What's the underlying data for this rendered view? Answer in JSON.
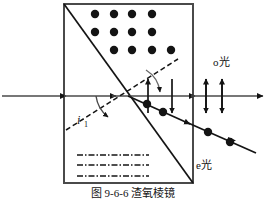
{
  "figure": {
    "caption": "图 9-6-6  渣氧棱镜",
    "background_color": "#ffffff",
    "ink_color": "#141414",
    "width": 267,
    "height": 199
  },
  "prism": {
    "name": "birefringent-crystal-block",
    "left": 64,
    "top": 4,
    "right": 193,
    "bottom": 183,
    "border_color": "#4a4a4a",
    "border_width": 2,
    "diagonal": {
      "from_x": 64,
      "from_y": 4,
      "to_x": 193,
      "to_y": 183,
      "color": "#141414",
      "width": 1.6
    }
  },
  "optic_axis_markers": {
    "dots": {
      "label": "optic-axis-perpendicular-dots",
      "rows": [
        {
          "y": 14,
          "xs": [
            95,
            114,
            132,
            152
          ]
        },
        {
          "y": 32,
          "xs": [
            95,
            114,
            132,
            152
          ]
        },
        {
          "y": 50,
          "xs": [
            114,
            132,
            152,
            171
          ]
        }
      ],
      "radius": 4.2,
      "color": "#141414"
    },
    "dash_dot_lines": {
      "label": "optic-axis-in-plane-lines",
      "lines": [
        {
          "y": 155,
          "x1": 77,
          "x2": 149
        },
        {
          "y": 165,
          "x1": 77,
          "x2": 149
        },
        {
          "y": 176,
          "x1": 77,
          "x2": 149
        }
      ],
      "color": "#141414",
      "width": 1.6,
      "dash_pattern": "6 2 1.5 2"
    }
  },
  "rays": {
    "incident": {
      "name": "incident-ray",
      "y": 96,
      "from_x": 2,
      "to_x": 64,
      "arrow_at_x": 64
    },
    "o_ray": {
      "name": "o-ray-horizontal",
      "label": "o光",
      "label_x": 216,
      "label_y": 62,
      "y": 96,
      "segments": [
        {
          "from_x": 64,
          "to_x": 193
        },
        {
          "from_x": 193,
          "to_x": 264
        }
      ],
      "arrow_positions_x": [
        113,
        193,
        260
      ],
      "polarization_arrows_x": [
        148,
        172,
        206,
        222
      ],
      "polarization_arrow_half_height": 17
    },
    "e_ray": {
      "name": "e-ray-refracted",
      "label": "e光",
      "label_x": 196,
      "label_y": 165,
      "from_x": 128,
      "from_y": 96,
      "to_x": 256,
      "to_y": 153,
      "arrow_positions_x": [
        186,
        231
      ],
      "polarization_dots_x": [
        146,
        161,
        205,
        228
      ],
      "dot_radius": 4.0
    },
    "normal_dashed": {
      "name": "normal-dashed-line",
      "from_x": 66,
      "from_y": 130,
      "to_x": 178,
      "to_y": 59,
      "color": "#141414",
      "dash_pattern": "5 3"
    }
  },
  "labels": {
    "incidence_angle": {
      "name": "incidence-angle-label",
      "symbol": "i",
      "subscript": "1",
      "x": 79,
      "y": 120
    },
    "o_light": "o光",
    "e_light": "e光"
  },
  "arcs": {
    "incidence_arc": {
      "name": "incidence-angle-arc",
      "cx": 128,
      "cy": 96
    },
    "refraction_arc": {
      "name": "refraction-angle-arc",
      "cx": 128,
      "cy": 96
    }
  }
}
